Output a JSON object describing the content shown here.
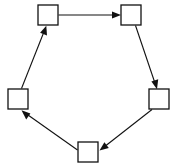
{
  "diagram": {
    "type": "directed-cycle-graph",
    "background_color": "#ffffff",
    "line_color": "#111111",
    "node_fill_color": "#ffffff",
    "node_stroke_color": "#111111",
    "node_size": 20,
    "node_count": 5,
    "edge_count": 5,
    "direction": "clockwise",
    "nodes": [
      {
        "id": "top-left",
        "label": "",
        "x": 48,
        "y": 15
      },
      {
        "id": "top-right",
        "label": "",
        "x": 131,
        "y": 15
      },
      {
        "id": "right",
        "label": "",
        "x": 159,
        "y": 99
      },
      {
        "id": "bottom",
        "label": "",
        "x": 88,
        "y": 152
      },
      {
        "id": "left",
        "label": "",
        "x": 18,
        "y": 99
      }
    ],
    "edges": [
      {
        "from": "top-left",
        "to": "top-right",
        "arrow": "end"
      },
      {
        "from": "top-right",
        "to": "right",
        "arrow": "end"
      },
      {
        "from": "right",
        "to": "bottom",
        "arrow": "end"
      },
      {
        "from": "bottom",
        "to": "left",
        "arrow": "end"
      },
      {
        "from": "left",
        "to": "top-left",
        "arrow": "end"
      }
    ]
  }
}
